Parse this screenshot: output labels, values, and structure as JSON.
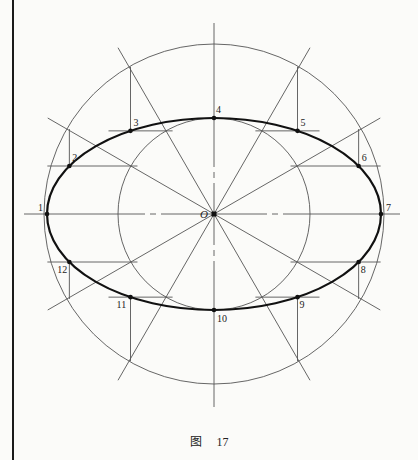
{
  "figure": {
    "type": "ellipse construction (concentric circle method)",
    "caption_prefix": "图",
    "caption_number": "17",
    "center_label": "O",
    "colors": {
      "construction_line": "#555555",
      "ellipse": "#111111",
      "point": "#111111",
      "border": "#1a1a1a"
    },
    "ellipse_points": [
      {
        "label": "1",
        "angle_deg": 180
      },
      {
        "label": "2",
        "angle_deg": 150
      },
      {
        "label": "3",
        "angle_deg": 120
      },
      {
        "label": "4",
        "angle_deg": 90
      },
      {
        "label": "5",
        "angle_deg": 60
      },
      {
        "label": "6",
        "angle_deg": 30
      },
      {
        "label": "7",
        "angle_deg": 0
      },
      {
        "label": "8",
        "angle_deg": -30
      },
      {
        "label": "9",
        "angle_deg": -60
      },
      {
        "label": "10",
        "angle_deg": -90
      },
      {
        "label": "11",
        "angle_deg": -120
      },
      {
        "label": "12",
        "angle_deg": -150
      }
    ],
    "divisions": 12,
    "axis_ratio_minor_to_major": 0.575
  }
}
